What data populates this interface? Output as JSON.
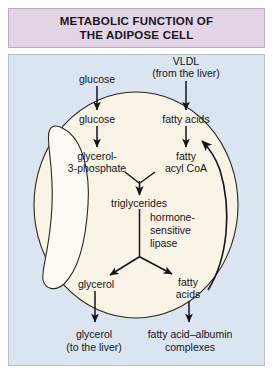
{
  "title": {
    "line1": "METABOLIC FUNCTION OF",
    "line2": "THE ADIPOSE CELL"
  },
  "colors": {
    "title_banner_bg": "#e4d5e6",
    "title_banner_border": "#b9aec0",
    "panel_bg": "#dbe5f1",
    "panel_border": "#b6bfcd",
    "cell_fill": "#faf4e6",
    "cell_stroke": "#2b2620",
    "droplet_fill": "#fdfbf3",
    "text": "#16131a",
    "arrow": "#16131a"
  },
  "diagram": {
    "type": "biological-pathway",
    "extracellular_inputs": [
      {
        "id": "glucose-out",
        "label": "glucose",
        "x": 97,
        "y": 79
      },
      {
        "id": "vldl-out",
        "label": "VLDL",
        "x": 186,
        "y": 61
      },
      {
        "id": "vldl-source",
        "label": "(from the liver)",
        "x": 186,
        "y": 74
      }
    ],
    "intracellular_nodes": [
      {
        "id": "glucose-in",
        "label": "glucose",
        "x": 97,
        "y": 119
      },
      {
        "id": "fatty-acids-in",
        "label": "fatty acids",
        "x": 186,
        "y": 119
      },
      {
        "id": "g3p-line1",
        "label": "glycerol-",
        "x": 97,
        "y": 156
      },
      {
        "id": "g3p-line2",
        "label": "3-phosphate",
        "x": 97,
        "y": 168
      },
      {
        "id": "acylcoa-line1",
        "label": "fatty",
        "x": 186,
        "y": 156
      },
      {
        "id": "acylcoa-line2",
        "label": "acyl CoA",
        "x": 186,
        "y": 168
      },
      {
        "id": "triglycerides",
        "label": "triglycerides",
        "x": 139,
        "y": 203
      },
      {
        "id": "glycerol-in",
        "label": "glycerol",
        "x": 97,
        "y": 284
      },
      {
        "id": "fatty-acids-out-line1",
        "label": "fatty",
        "x": 186,
        "y": 282
      },
      {
        "id": "fatty-acids-out-line2",
        "label": "acids",
        "x": 186,
        "y": 294
      }
    ],
    "enzyme_annotation": {
      "id": "hormone-sensitive-lipase",
      "lines": [
        "hormone-",
        "sensitive",
        "lipase"
      ],
      "x": 152,
      "y": 216
    },
    "extracellular_outputs": [
      {
        "id": "glycerol-liver-line1",
        "label": "glycerol",
        "x": 93,
        "y": 334
      },
      {
        "id": "glycerol-liver-line2",
        "label": "(to the liver)",
        "x": 93,
        "y": 347
      },
      {
        "id": "fa-albumin-line1",
        "label": "fatty acid–albumin",
        "x": 190,
        "y": 334
      },
      {
        "id": "fa-albumin-line2",
        "label": "complexes",
        "x": 190,
        "y": 347
      }
    ],
    "arrows": [
      {
        "id": "glucose-uptake-arrow",
        "from": "glucose-out",
        "to": "glucose-in"
      },
      {
        "id": "vldl-uptake-arrow",
        "from": "vldl-out",
        "to": "fatty-acids-in"
      },
      {
        "id": "glucose-to-g3p-arrow",
        "from": "glucose-in",
        "to": "g3p-line1"
      },
      {
        "id": "fa-to-acylcoa-arrow",
        "from": "fatty-acids-in",
        "to": "acylcoa-line1"
      },
      {
        "id": "esterification-arrow",
        "from": "g3p-and-acylcoa",
        "to": "triglycerides"
      },
      {
        "id": "lipolysis-glycerol-arrow",
        "from": "triglycerides",
        "to": "glycerol-in"
      },
      {
        "id": "lipolysis-fattyacid-arrow",
        "from": "triglycerides",
        "to": "fatty-acids-out-line1"
      },
      {
        "id": "glycerol-export-arrow",
        "from": "glycerol-in",
        "to": "glycerol-liver-line1"
      },
      {
        "id": "fattyacid-export-arrow",
        "from": "fatty-acids-out-line2",
        "to": "fa-albumin-line1"
      },
      {
        "id": "fattyacid-recycle-arrow",
        "from": "fatty-acids-out",
        "to": "acylcoa"
      }
    ],
    "structures": [
      {
        "id": "adipose-cell-membrane",
        "shape": "ellipse"
      },
      {
        "id": "lipid-droplet",
        "shape": "crescent"
      }
    ]
  }
}
